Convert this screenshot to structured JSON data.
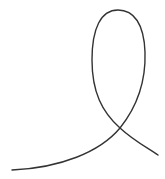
{
  "figure": {
    "type": "single-loop-curve",
    "background": "#ffffff",
    "stroke_color": "#333333",
    "stroke_width": 1.4,
    "path": "M12,170 C60,168 100,152 120,128 C136,108 146,82 145,52 C144,24 134,10 118,10 C101,10 92,28 92,60 C92,92 102,112 120,128 C134,141 148,148 158,155",
    "start_point": [
      12,
      170
    ],
    "crossing_point": [
      120,
      128
    ],
    "loop_top": [
      118,
      10
    ],
    "end_point": [
      158,
      155
    ]
  }
}
